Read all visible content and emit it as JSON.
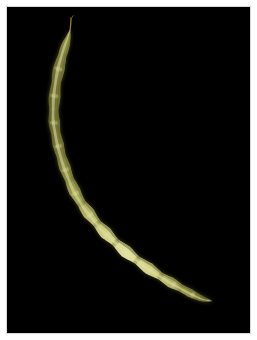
{
  "image": {
    "subject": "yellow wax bean pod",
    "background_color": "#000000",
    "frame_color": "#ffffff",
    "frame_border_color": "#d8d8d8",
    "canvas": {
      "width": 257,
      "height": 340
    },
    "photo_area": {
      "x": 7,
      "y": 7,
      "width": 243,
      "height": 326
    }
  },
  "subject": {
    "name": "bean-pod",
    "label": "Bean pod",
    "orientation": "diagonal, curving from upper-left to lower-right",
    "colors": {
      "body_light": "#e2e2a4",
      "body_mid": "#c9c97a",
      "body_core": "#b9b96a",
      "body_shadow": "#7e7e3c",
      "body_edge": "#5c5c28",
      "stem": "#9a7d30",
      "stem_tip": "#6b5420"
    },
    "top_tip": {
      "x": 70,
      "y": 18
    },
    "bottom_tip": {
      "x": 212,
      "y": 300
    },
    "segments": 14,
    "style_length_px": 14
  },
  "pod_path": {
    "centerline": [
      {
        "x": 70,
        "y": 30,
        "w": 3
      },
      {
        "x": 68,
        "y": 38,
        "w": 6
      },
      {
        "x": 64,
        "y": 50,
        "w": 10
      },
      {
        "x": 60,
        "y": 64,
        "w": 12
      },
      {
        "x": 57,
        "y": 78,
        "w": 12
      },
      {
        "x": 55,
        "y": 92,
        "w": 12
      },
      {
        "x": 54,
        "y": 106,
        "w": 12
      },
      {
        "x": 54,
        "y": 120,
        "w": 12
      },
      {
        "x": 56,
        "y": 134,
        "w": 12
      },
      {
        "x": 59,
        "y": 148,
        "w": 12
      },
      {
        "x": 63,
        "y": 162,
        "w": 12
      },
      {
        "x": 68,
        "y": 176,
        "w": 12
      },
      {
        "x": 74,
        "y": 190,
        "w": 12
      },
      {
        "x": 82,
        "y": 204,
        "w": 12
      },
      {
        "x": 91,
        "y": 216,
        "w": 12
      },
      {
        "x": 101,
        "y": 228,
        "w": 12
      },
      {
        "x": 112,
        "y": 239,
        "w": 12
      },
      {
        "x": 124,
        "y": 250,
        "w": 12
      },
      {
        "x": 137,
        "y": 260,
        "w": 12
      },
      {
        "x": 151,
        "y": 270,
        "w": 11
      },
      {
        "x": 165,
        "y": 279,
        "w": 11
      },
      {
        "x": 179,
        "y": 287,
        "w": 10
      },
      {
        "x": 192,
        "y": 294,
        "w": 9
      },
      {
        "x": 203,
        "y": 299,
        "w": 7
      },
      {
        "x": 212,
        "y": 301,
        "w": 4
      }
    ],
    "constrictions_t": [
      0.1,
      0.18,
      0.26,
      0.33,
      0.4,
      0.47,
      0.54,
      0.61,
      0.68,
      0.75,
      0.82,
      0.88,
      0.94
    ]
  }
}
